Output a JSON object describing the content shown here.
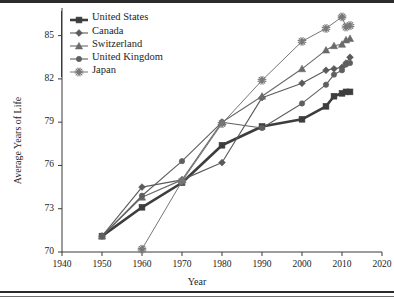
{
  "chart_data": {
    "type": "line",
    "title": "",
    "xlabel": "Year",
    "ylabel": "Average Years of Life",
    "xlim": [
      1940,
      2020
    ],
    "ylim": [
      70,
      86.5
    ],
    "xticks": [
      1940,
      1950,
      1960,
      1970,
      1980,
      1990,
      2000,
      2010,
      2020
    ],
    "yticks": [
      70,
      73,
      76,
      79,
      82,
      85
    ],
    "grid": false,
    "legend_position": "top-left",
    "series": [
      {
        "name": "United States",
        "marker": "square",
        "color": "#3d3d3d",
        "line_width": 2.6,
        "x": [
          1950,
          1960,
          1970,
          1980,
          1990,
          2000,
          2006,
          2008,
          2010,
          2011,
          2012
        ],
        "y": [
          71.1,
          73.1,
          74.8,
          77.4,
          78.7,
          79.2,
          80.1,
          80.8,
          81.0,
          81.1,
          81.1
        ]
      },
      {
        "name": "Canada",
        "marker": "diamond",
        "color": "#5a5a5a",
        "line_width": 1.1,
        "x": [
          1950,
          1960,
          1970,
          1980,
          1990,
          2000,
          2006,
          2008,
          2010,
          2011,
          2012
        ],
        "y": [
          71.1,
          74.5,
          75.0,
          76.2,
          80.7,
          81.7,
          82.6,
          82.7,
          82.8,
          83.1,
          83.5
        ]
      },
      {
        "name": "Switzerland",
        "marker": "triangle",
        "color": "#6a6a6a",
        "line_width": 1.1,
        "x": [
          1950,
          1960,
          1970,
          1980,
          1990,
          2000,
          2006,
          2008,
          2010,
          2011,
          2012
        ],
        "y": [
          71.1,
          73.8,
          75.0,
          79.0,
          80.8,
          82.7,
          84.0,
          84.3,
          84.4,
          84.7,
          84.8
        ]
      },
      {
        "name": "United Kingdom",
        "marker": "circle",
        "color": "#5f5f5f",
        "line_width": 1.1,
        "x": [
          1950,
          1960,
          1970,
          1980,
          1990,
          2000,
          2006,
          2008,
          2010,
          2011,
          2012
        ],
        "y": [
          71.1,
          73.9,
          76.3,
          79.0,
          78.6,
          80.3,
          81.6,
          82.3,
          82.6,
          83.0,
          83.1
        ]
      },
      {
        "name": "Japan",
        "marker": "asterisk",
        "color": "#777777",
        "line_width": 1.0,
        "x": [
          1960,
          1970,
          1980,
          1990,
          2000,
          2006,
          2010,
          2011,
          2012
        ],
        "y": [
          70.2,
          74.9,
          78.9,
          81.9,
          84.6,
          85.5,
          86.3,
          85.6,
          85.7
        ]
      }
    ]
  },
  "axis": {
    "xlabel": "Year",
    "ylabel": "Average Years of Life",
    "xticks": [
      "1940",
      "1950",
      "1960",
      "1970",
      "1980",
      "1990",
      "2000",
      "2010",
      "2020"
    ],
    "yticks": [
      "85",
      "82",
      "79",
      "76",
      "73",
      "70"
    ]
  },
  "legend": {
    "items": [
      {
        "label": "United States"
      },
      {
        "label": "Canada"
      },
      {
        "label": "Switzerland"
      },
      {
        "label": "United Kingdom"
      },
      {
        "label": "Japan"
      }
    ]
  }
}
